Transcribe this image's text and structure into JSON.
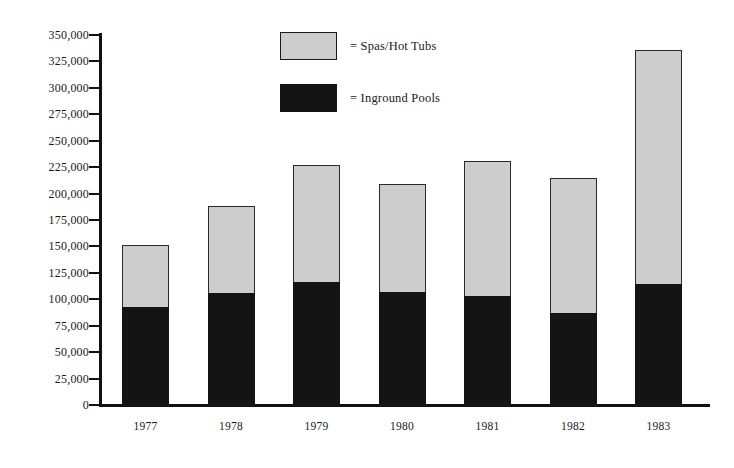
{
  "chart_data": {
    "type": "bar",
    "subtype": "stacked-vertical",
    "title": "",
    "subtitle": "",
    "xlabel": "",
    "ylabel": "",
    "categories": [
      "1977",
      "1978",
      "1979",
      "1980",
      "1981",
      "1982",
      "1983"
    ],
    "series": [
      {
        "name": "Inground Pools",
        "color": "#141414",
        "values": [
          95000,
          108000,
          118000,
          109000,
          105000,
          89000,
          116000
        ]
      },
      {
        "name": "Spas/Hot Tubs",
        "color": "#cdcdcd",
        "values": [
          58000,
          82000,
          111000,
          102000,
          128000,
          128000,
          222000
        ]
      }
    ],
    "totals": [
      153000,
      190000,
      229000,
      211000,
      233000,
      217000,
      338000
    ],
    "ylim": [
      0,
      350000
    ],
    "y_tick_step": 25000,
    "y_ticks": [
      "350,000",
      "325,000",
      "300,000",
      "275,000",
      "250,000",
      "225,000",
      "200,000",
      "175,000",
      "150,000",
      "125,000",
      "100,000",
      "75,000",
      "50,000",
      "25,000",
      "0"
    ],
    "y_tick_values": [
      350000,
      325000,
      300000,
      275000,
      250000,
      225000,
      200000,
      175000,
      150000,
      125000,
      100000,
      75000,
      50000,
      25000,
      0
    ],
    "grid": false,
    "legend_position": "top-center",
    "legend": [
      {
        "marker": "gray-swatch",
        "prefix": "=",
        "label": "Spas/Hot Tubs",
        "color": "#cdcdcd"
      },
      {
        "marker": "black-swatch",
        "prefix": "=",
        "label": "Inground Pools",
        "color": "#141414"
      }
    ]
  },
  "legend": {
    "rows": [
      {
        "equals": "=",
        "label": "Spas/Hot Tubs"
      },
      {
        "equals": "=",
        "label": "Inground Pools"
      }
    ]
  },
  "axis": {
    "y_labels": [
      "350,000",
      "325,000",
      "300,000",
      "275,000",
      "250,000",
      "225,000",
      "200,000",
      "175,000",
      "150,000",
      "125,000",
      "100,000",
      "75,000",
      "50,000",
      "25,000",
      "0"
    ],
    "x_labels": [
      "1977",
      "1978",
      "1979",
      "1980",
      "1981",
      "1982",
      "1983"
    ]
  },
  "colors": {
    "spas_hot_tubs": "#cdcdcd",
    "inground_pools": "#141414",
    "axis": "#111111",
    "background": "#ffffff"
  }
}
